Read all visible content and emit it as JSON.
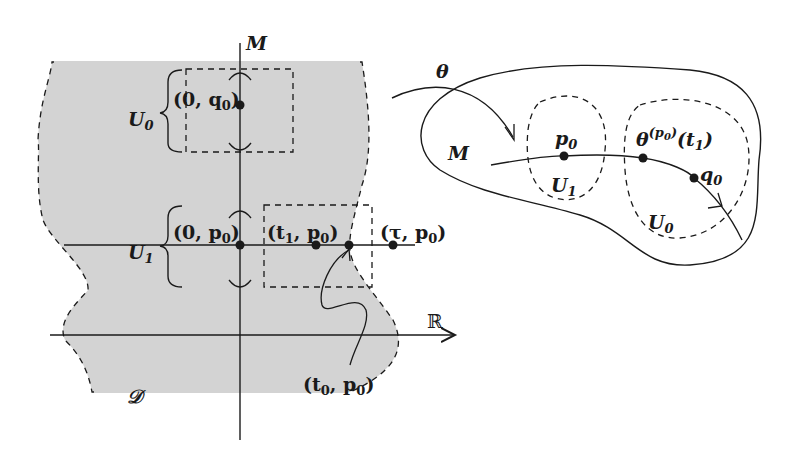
{
  "diagram": {
    "left_panel": {
      "region_label": "𝒟",
      "vertical_axis_label": "M",
      "horizontal_axis_label": "ℝ",
      "set_labels": [
        {
          "name": "U",
          "sub": "0"
        },
        {
          "name": "U",
          "sub": "1"
        }
      ],
      "points": [
        {
          "id": "zero-q0",
          "text": "(0, q",
          "sub": "0",
          "close": ")"
        },
        {
          "id": "zero-p0",
          "text": "(0, p",
          "sub": "0",
          "close": ")"
        },
        {
          "id": "t1-p0",
          "pre": "(t",
          "presub": "1",
          "text": ", p",
          "sub": "0",
          "close": ")"
        },
        {
          "id": "tau-p0",
          "text": "(τ, p",
          "sub": "0",
          "close": ")"
        },
        {
          "id": "t0-p0",
          "pre": "(t",
          "presub": "0",
          "text": ", p",
          "sub": "0",
          "close": ")"
        }
      ]
    },
    "arrow_label": "θ",
    "right_panel": {
      "manifold_label": "M",
      "set_labels": [
        {
          "name": "U",
          "sub": "1"
        },
        {
          "name": "U",
          "sub": "0"
        }
      ],
      "points": [
        {
          "id": "p0",
          "text": "p",
          "sub": "0"
        },
        {
          "id": "theta-p0-t1",
          "text": "θ",
          "sup": "(p",
          "supsub": "0",
          "supclose": ")",
          "arg": "(t",
          "argsub": "1",
          "argclose": ")"
        },
        {
          "id": "q0",
          "text": "q",
          "sub": "0"
        }
      ]
    },
    "colors": {
      "region_fill": "#d3d3d3",
      "stroke": "#1a1a1a",
      "background": "#ffffff"
    }
  }
}
